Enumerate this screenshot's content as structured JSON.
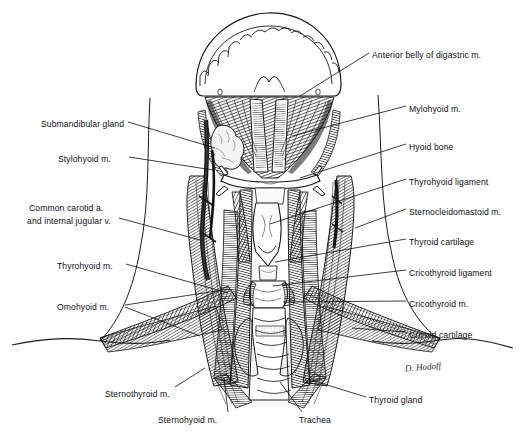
{
  "figure": {
    "signature": "D. Hodoff",
    "ink_color": "#1a1a1a",
    "paper_color": "#ffffff",
    "leader_color": "#000000"
  },
  "labels_right": [
    {
      "id": "anterior-belly-digastric",
      "text": "Anterior belly of digastric m.",
      "x": 372,
      "y": 50,
      "leader": [
        [
          369,
          53
        ],
        [
          300,
          96
        ]
      ]
    },
    {
      "id": "mylohyoid",
      "text": "Mylohyoid m.",
      "x": 409,
      "y": 104,
      "leader": [
        [
          406,
          106
        ],
        [
          292,
          136
        ]
      ]
    },
    {
      "id": "hyoid-bone",
      "text": "Hyoid bone",
      "x": 409,
      "y": 142,
      "leader": [
        [
          406,
          144
        ],
        [
          300,
          178
        ]
      ]
    },
    {
      "id": "thyrohyoid-ligament",
      "text": "Thyrohyoid ligament",
      "x": 409,
      "y": 177,
      "leader": [
        [
          406,
          179
        ],
        [
          270,
          224
        ]
      ]
    },
    {
      "id": "sternocleidomastoid",
      "text": "Sternocleidomastoid m.",
      "x": 409,
      "y": 207,
      "leader": [
        [
          406,
          209
        ],
        [
          355,
          228
        ]
      ]
    },
    {
      "id": "thyroid-cartilage",
      "text": "Thyroid cartilage",
      "x": 409,
      "y": 237,
      "leader": [
        [
          406,
          239
        ],
        [
          275,
          262
        ]
      ]
    },
    {
      "id": "cricothyroid-ligament",
      "text": "Cricothyroid ligament",
      "x": 409,
      "y": 268,
      "leader": [
        [
          406,
          270
        ],
        [
          273,
          286
        ]
      ]
    },
    {
      "id": "cricothyroid-muscle",
      "text": "Cricothyroid m.",
      "x": 409,
      "y": 299,
      "leader": [
        [
          406,
          301
        ],
        [
          283,
          302
        ]
      ]
    },
    {
      "id": "cricoid-cartilage",
      "text": "Cricoid cartilage",
      "x": 409,
      "y": 330,
      "leader": [
        [
          406,
          332
        ],
        [
          352,
          328
        ]
      ]
    }
  ],
  "labels_left": [
    {
      "id": "submandibular-gland",
      "text": "Submandibular gland",
      "x": 41,
      "y": 119,
      "leader": [
        [
          128,
          122
        ],
        [
          215,
          148
        ]
      ]
    },
    {
      "id": "stylohyoid",
      "text": "Stylohyoid m.",
      "x": 58,
      "y": 154,
      "leader": [
        [
          129,
          157
        ],
        [
          213,
          170
        ]
      ]
    },
    {
      "id": "common-carotid-line1",
      "text": "Common carotid a.",
      "x": 29,
      "y": 203,
      "leader": null
    },
    {
      "id": "common-carotid-line2",
      "text": "and internal jugular v.",
      "x": 27,
      "y": 216,
      "leader": [
        [
          119,
          218
        ],
        [
          200,
          240
        ]
      ]
    },
    {
      "id": "thyrohyoid-muscle",
      "text": "Thyrohyoid m.",
      "x": 57,
      "y": 261,
      "leader": [
        [
          126,
          264
        ],
        [
          228,
          293
        ]
      ]
    },
    {
      "id": "omohyoid",
      "text": "Omohyoid m.",
      "x": 57,
      "y": 302,
      "leader": [
        [
          125,
          305
        ],
        [
          230,
          289
        ]
      ]
    }
  ],
  "labels_bottom": [
    {
      "id": "sternothyroid",
      "text": "Sternothyroid m.",
      "x": 105,
      "y": 389,
      "leader": [
        [
          175,
          387
        ],
        [
          205,
          368
        ]
      ]
    },
    {
      "id": "sternohyoid",
      "text": "Sternohyoid m.",
      "x": 158,
      "y": 415,
      "leader": [
        [
          228,
          412
        ],
        [
          224,
          378
        ]
      ]
    },
    {
      "id": "trachea",
      "text": "Trachea",
      "x": 299,
      "y": 415,
      "leader": [
        [
          302,
          412
        ],
        [
          280,
          382
        ]
      ]
    },
    {
      "id": "thyroid-gland",
      "text": "Thyroid gland",
      "x": 369,
      "y": 395,
      "leader": [
        [
          366,
          397
        ],
        [
          295,
          375
        ]
      ]
    }
  ],
  "structures": [
    {
      "name": "mandible",
      "region": "superior arch with teeth"
    },
    {
      "name": "teeth-row",
      "region": "scalloped inferior border of mandible"
    },
    {
      "name": "mylohyoid-muscle",
      "region": "floor of mouth, fan shaped"
    },
    {
      "name": "digastric-anterior",
      "region": "paired midline strap below chin"
    },
    {
      "name": "submandibular-gland",
      "region": "left lateral lobulated gland"
    },
    {
      "name": "hyoid-bone",
      "region": "transverse midline bone"
    },
    {
      "name": "thyroid-cartilage",
      "region": "midline laryngeal shield"
    },
    {
      "name": "cricoid-cartilage",
      "region": "ring below thyroid cartilage"
    },
    {
      "name": "trachea",
      "region": "midline segmented tube"
    },
    {
      "name": "thyroid-gland",
      "region": "bilobed gland over trachea"
    },
    {
      "name": "sternocleidomastoid",
      "region": "large oblique lateral strap muscles"
    },
    {
      "name": "omohyoid-muscle",
      "region": "oblique strap to shoulder"
    },
    {
      "name": "sternohyoid-muscle",
      "region": "vertical midline strap"
    },
    {
      "name": "sternothyroid-muscle",
      "region": "deep vertical strap"
    },
    {
      "name": "carotid-artery",
      "region": "left neurovascular bundle"
    },
    {
      "name": "clavicle-contour",
      "region": "lower shoulder outline"
    }
  ]
}
